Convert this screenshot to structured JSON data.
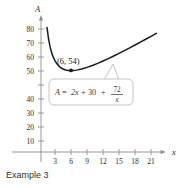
{
  "caption": "Example 3",
  "chart_data": {
    "type": "line",
    "title": "",
    "xlabel": "x",
    "ylabel": "A",
    "equation_display": "A = 2x + 30 + 72/x",
    "equation_parts": {
      "lhs": "A",
      "equals": "=",
      "term1": "2x",
      "plus1": "+",
      "term2": "30",
      "plus2": "+",
      "numerator": "72",
      "denominator": "x"
    },
    "xlim": [
      0,
      23
    ],
    "ylim": [
      0,
      88
    ],
    "xticks": [
      3,
      6,
      9,
      12,
      15,
      18,
      21
    ],
    "xtick_labels": [
      "3",
      "6",
      "9",
      "12",
      "15",
      "18",
      "21"
    ],
    "yticks": [
      10,
      20,
      30,
      40,
      50,
      60,
      70,
      80
    ],
    "ytick_labels": [
      "10",
      "20",
      "30",
      "40",
      "50",
      "60",
      "70",
      "80"
    ],
    "grid": false,
    "legend": "none",
    "annotations": [
      {
        "name": "minimum-point",
        "label": "(6, 54)",
        "x": 6,
        "y": 54,
        "marker": "filled-dot"
      }
    ],
    "series": [
      {
        "name": "A(x) = 2x + 30 + 72/x",
        "color": "#1a1a1a",
        "x": [
          1.2,
          1.5,
          1.8,
          2.1,
          2.5,
          3.0,
          3.5,
          4.0,
          4.5,
          5.0,
          5.5,
          6.0,
          6.5,
          7.0,
          8.0,
          9.0,
          10.0,
          11.0,
          12.0,
          13.0,
          14.0,
          15.0,
          16.0,
          17.0,
          18.0,
          19.0,
          20.0,
          21.0,
          22.0
        ],
        "y": [
          92.4,
          81.0,
          73.6,
          68.5,
          63.8,
          60.0,
          57.6,
          56.0,
          55.0,
          54.4,
          54.1,
          54.0,
          54.1,
          54.3,
          55.0,
          56.0,
          57.2,
          58.5,
          60.0,
          61.5,
          63.1,
          64.8,
          66.5,
          68.2,
          70.0,
          71.8,
          73.6,
          75.4,
          77.3
        ]
      }
    ]
  }
}
